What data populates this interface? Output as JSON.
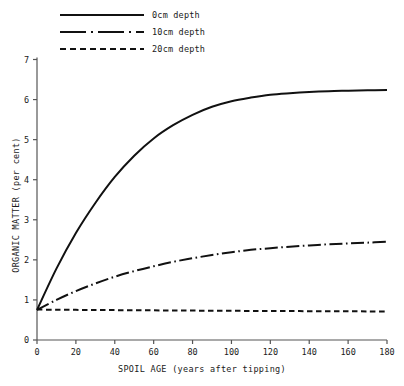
{
  "chart_data": {
    "type": "line",
    "title": "",
    "xlabel": "SPOIL AGE (years after tipping)",
    "ylabel": "ORGANIC MATTER (per cent)",
    "xlim": [
      0,
      180
    ],
    "ylim": [
      0,
      7
    ],
    "xticks": [
      0,
      20,
      40,
      60,
      80,
      100,
      120,
      140,
      160,
      180
    ],
    "yticks": [
      0,
      1,
      2,
      3,
      4,
      5,
      6,
      7
    ],
    "xtick_labels": [
      "0",
      "20",
      "40",
      "60",
      "80",
      "100",
      "120",
      "140",
      "160",
      "180"
    ],
    "ytick_labels": [
      "0",
      "1",
      "2",
      "3",
      "4",
      "5",
      "6",
      "7"
    ],
    "grid": false,
    "legend_position": "top-left",
    "x": [
      0,
      10,
      20,
      30,
      40,
      50,
      60,
      70,
      80,
      90,
      100,
      110,
      120,
      130,
      140,
      150,
      160,
      170,
      180
    ],
    "series": [
      {
        "name": "0cm depth",
        "label": "0cm depth",
        "linestyle": "solid",
        "color": "#111111",
        "values": [
          0.75,
          1.78,
          2.67,
          3.42,
          4.07,
          4.6,
          5.03,
          5.36,
          5.62,
          5.82,
          5.96,
          6.05,
          6.12,
          6.16,
          6.19,
          6.21,
          6.22,
          6.23,
          6.24
        ]
      },
      {
        "name": "10cm depth",
        "label": "10cm depth",
        "linestyle": "dashdot",
        "color": "#111111",
        "values": [
          0.75,
          1.0,
          1.22,
          1.41,
          1.58,
          1.72,
          1.84,
          1.95,
          2.04,
          2.12,
          2.19,
          2.25,
          2.29,
          2.33,
          2.36,
          2.39,
          2.41,
          2.43,
          2.45
        ]
      },
      {
        "name": "20cm depth",
        "label": "20cm depth",
        "linestyle": "dashed",
        "color": "#111111",
        "values": [
          0.76,
          0.755,
          0.752,
          0.749,
          0.746,
          0.743,
          0.74,
          0.737,
          0.734,
          0.731,
          0.728,
          0.726,
          0.724,
          0.722,
          0.72,
          0.718,
          0.716,
          0.714,
          0.712
        ]
      }
    ]
  },
  "legend": {
    "items": [
      {
        "label": "0cm depth",
        "style": "solid"
      },
      {
        "label": "10cm depth",
        "style": "dashdot"
      },
      {
        "label": "20cm depth",
        "style": "dashed"
      }
    ]
  },
  "axes": {
    "x_title": "SPOIL AGE (years after tipping)",
    "y_title": "ORGANIC MATTER (per cent)"
  }
}
